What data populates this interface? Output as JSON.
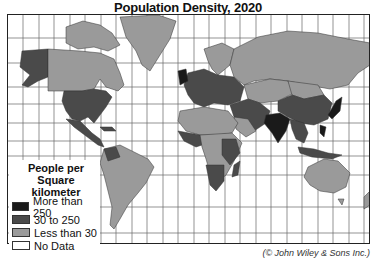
{
  "title": "Population Density, 2020",
  "legend": {
    "title_line1": "People per Square",
    "title_line2": "kilometer",
    "items": [
      {
        "label": "More than 250",
        "color": "#1a1a1a"
      },
      {
        "label": "30 to 250",
        "color": "#4a4a4a"
      },
      {
        "label": "Less than 30",
        "color": "#9a9a9a"
      },
      {
        "label": "No Data",
        "color": "#ffffff"
      }
    ]
  },
  "credit": "(© John Wiley & Sons Inc.)",
  "colors": {
    "high": "#1a1a1a",
    "medium": "#4a4a4a",
    "low": "#9a9a9a",
    "nodata": "#ffffff",
    "grid": "#555555",
    "border": "#222222"
  }
}
